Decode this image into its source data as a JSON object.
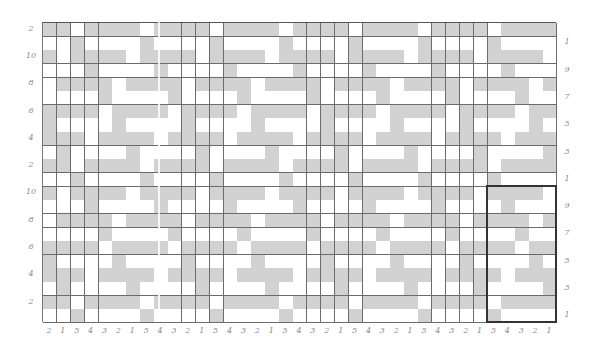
{
  "chart_data": {
    "type": "table",
    "title": "",
    "columns": 37,
    "rows": 22,
    "colors": {
      "contrast": "#d2d2d2",
      "main": "#ffffff",
      "grid": "#6b6b6b",
      "repeat_box": "#333333",
      "labels": "#8a8a8a"
    },
    "repeat": {
      "stitch_labels": [
        "5",
        "4",
        "3",
        "2",
        "1"
      ],
      "rows_bottom_to_top": [
        "GWWWW",
        "WGGGG",
        "WWWWG",
        "GWGGG",
        "WWWGW",
        "GGWGG",
        "WWGWW",
        "GGGWG",
        "WGWWW",
        "GGGGW"
      ]
    },
    "bottom_labels": [
      "2",
      "1",
      "5",
      "4",
      "3",
      "2",
      "1",
      "5",
      "4",
      "3",
      "2",
      "1",
      "5",
      "4",
      "3",
      "2",
      "1",
      "5",
      "4",
      "3",
      "2",
      "1",
      "5",
      "4",
      "3",
      "2",
      "1",
      "5",
      "4",
      "3",
      "2",
      "1",
      "5",
      "4",
      "3",
      "2",
      "1"
    ],
    "left_labels": [
      "2",
      "10",
      "8",
      "6",
      "4",
      "2",
      "10",
      "8",
      "6",
      "4",
      "2"
    ],
    "right_labels": [
      "1",
      "9",
      "7",
      "5",
      "3",
      "1",
      "9",
      "7",
      "5",
      "3",
      "1"
    ],
    "repeat_box": {
      "col_start": 33,
      "col_end": 37,
      "row_start_from_top": 13,
      "row_end_from_top": 22
    }
  }
}
